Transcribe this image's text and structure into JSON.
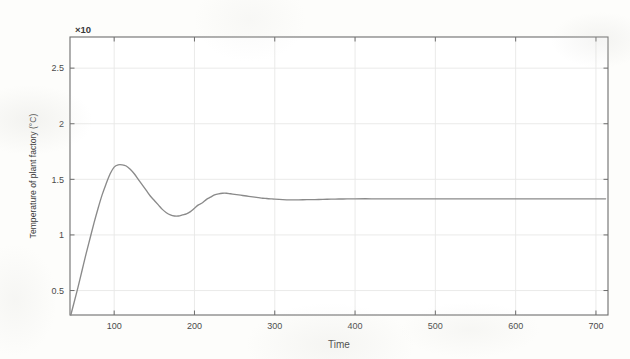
{
  "chart_data": {
    "type": "line",
    "title": "",
    "xlabel": "Time",
    "ylabel": "Temperature of plant factory (°C)",
    "y_multiplier": "×10",
    "xlim": [
      45,
      715
    ],
    "ylim": [
      0.28,
      2.78
    ],
    "xticks": [
      100,
      200,
      300,
      400,
      500,
      600,
      700
    ],
    "xtick_labels": [
      "100",
      "200",
      "300",
      "400",
      "500",
      "600",
      "700"
    ],
    "yticks": [
      0.5,
      1,
      1.5,
      2,
      2.5
    ],
    "ytick_labels": [
      "0.5",
      "1",
      "1.5",
      "2",
      "2.5"
    ],
    "grid": true,
    "legend": "none",
    "series": [
      {
        "name": "Temperature step response",
        "color": "#8a8a8a",
        "annotations": {
          "first_overshoot_peak": {
            "x": 100,
            "y": 1.63
          },
          "first_trough": {
            "x": 166,
            "y": 1.18
          },
          "second_overshoot_peak": {
            "x": 237,
            "y": 1.37
          },
          "steady_state": 1.325,
          "rise_start_x": 46
        },
        "x": [
          46,
          50,
          55,
          60,
          65,
          70,
          75,
          80,
          85,
          90,
          95,
          100,
          105,
          110,
          115,
          120,
          125,
          130,
          135,
          140,
          145,
          150,
          155,
          160,
          165,
          170,
          175,
          180,
          185,
          190,
          195,
          200,
          205,
          210,
          215,
          220,
          225,
          230,
          235,
          240,
          245,
          250,
          255,
          260,
          265,
          270,
          275,
          280,
          285,
          290,
          295,
          300,
          310,
          320,
          330,
          340,
          350,
          360,
          370,
          380,
          390,
          400,
          420,
          440,
          460,
          480,
          500,
          520,
          540,
          560,
          580,
          600,
          620,
          640,
          660,
          680,
          700,
          712
        ],
        "y": [
          0.28,
          0.39,
          0.53,
          0.68,
          0.83,
          0.97,
          1.11,
          1.24,
          1.36,
          1.46,
          1.55,
          1.61,
          1.63,
          1.63,
          1.62,
          1.59,
          1.55,
          1.5,
          1.45,
          1.4,
          1.35,
          1.31,
          1.27,
          1.23,
          1.2,
          1.18,
          1.17,
          1.17,
          1.18,
          1.19,
          1.21,
          1.24,
          1.27,
          1.29,
          1.32,
          1.34,
          1.36,
          1.37,
          1.375,
          1.375,
          1.37,
          1.365,
          1.36,
          1.355,
          1.35,
          1.345,
          1.34,
          1.335,
          1.33,
          1.328,
          1.325,
          1.322,
          1.318,
          1.316,
          1.316,
          1.317,
          1.318,
          1.32,
          1.322,
          1.323,
          1.324,
          1.325,
          1.325,
          1.325,
          1.325,
          1.325,
          1.325,
          1.325,
          1.325,
          1.325,
          1.325,
          1.325,
          1.325,
          1.325,
          1.325,
          1.325,
          1.325,
          1.325
        ]
      }
    ]
  },
  "colors": {
    "curve": "#8a8a8a",
    "axis": "#6d6d6d",
    "grid": "#e8e8e6",
    "text": "#3a3a3a",
    "background": "#fdfdfb"
  }
}
